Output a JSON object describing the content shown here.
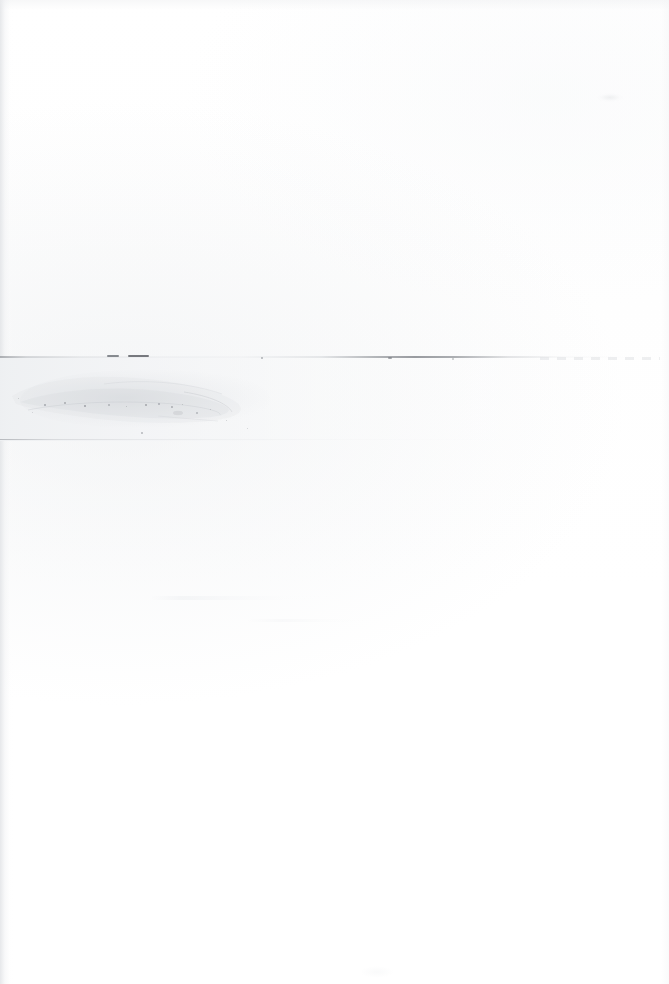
{
  "document": {
    "kind": "scanned-page",
    "content_state": "blank",
    "page_label": "",
    "description": "Blank scanned document page, white paper with scanner artifacts",
    "width_px": 669,
    "height_px": 984
  },
  "colors": {
    "paper": "#ffffff",
    "band_grey": "#eef0f2",
    "rule_dark": "#6c6f75",
    "rule_faint": "#a0a3a8",
    "smudge_grey": "#ced1d5",
    "speck_dark": "#8a8d93",
    "edge_shadow": "#e2e4e7"
  },
  "artifacts": {
    "rules": [
      {
        "name": "upper-scan-line",
        "y": 356,
        "x_start": 0,
        "x_end": 669,
        "thickness": 2,
        "tone": "dark"
      },
      {
        "name": "lower-scan-line",
        "y": 439,
        "x_start": 0,
        "x_end": 669,
        "thickness": 1,
        "tone": "faint"
      }
    ],
    "band": {
      "name": "mid-grey-band",
      "y": 357,
      "height": 84
    },
    "smudges": [
      {
        "name": "main-blotch",
        "x": 8,
        "y": 366,
        "w": 290,
        "h": 66
      },
      {
        "name": "top-right-smudge",
        "x": 597,
        "y": 93,
        "w": 26,
        "h": 9
      },
      {
        "name": "bottom-center-ghost",
        "x": 360,
        "y": 966,
        "w": 34,
        "h": 12
      }
    ],
    "dashes": [
      {
        "name": "dash-a",
        "x": 107,
        "y": 355,
        "w": 12
      },
      {
        "name": "dash-b",
        "x": 128,
        "y": 355,
        "w": 21
      },
      {
        "name": "dash-c",
        "x": 388,
        "y": 357,
        "w": 4
      }
    ],
    "specks": [
      {
        "x": 44,
        "y": 404,
        "d": 2.0,
        "o": 0.7
      },
      {
        "x": 64,
        "y": 402,
        "d": 1.6,
        "o": 0.6
      },
      {
        "x": 84,
        "y": 405,
        "d": 2.2,
        "o": 0.78
      },
      {
        "x": 108,
        "y": 404,
        "d": 1.5,
        "o": 0.52
      },
      {
        "x": 126,
        "y": 406,
        "d": 1.4,
        "o": 0.48
      },
      {
        "x": 145,
        "y": 404,
        "d": 2.0,
        "o": 0.72
      },
      {
        "x": 158,
        "y": 403,
        "d": 1.5,
        "o": 0.55
      },
      {
        "x": 171,
        "y": 406,
        "d": 1.8,
        "o": 0.62
      },
      {
        "x": 182,
        "y": 404,
        "d": 1.3,
        "o": 0.45
      },
      {
        "x": 196,
        "y": 412,
        "d": 1.6,
        "o": 0.5
      },
      {
        "x": 210,
        "y": 409,
        "d": 1.2,
        "o": 0.4
      },
      {
        "x": 141,
        "y": 432,
        "d": 1.8,
        "o": 0.58
      },
      {
        "x": 226,
        "y": 420,
        "d": 1.4,
        "o": 0.42
      },
      {
        "x": 247,
        "y": 428,
        "d": 1.3,
        "o": 0.38
      },
      {
        "x": 18,
        "y": 398,
        "d": 1.4,
        "o": 0.45
      },
      {
        "x": 32,
        "y": 412,
        "d": 1.2,
        "o": 0.35
      },
      {
        "x": 261,
        "y": 357,
        "d": 2.4,
        "o": 0.68
      },
      {
        "x": 452,
        "y": 358,
        "d": 1.6,
        "o": 0.45
      }
    ]
  }
}
